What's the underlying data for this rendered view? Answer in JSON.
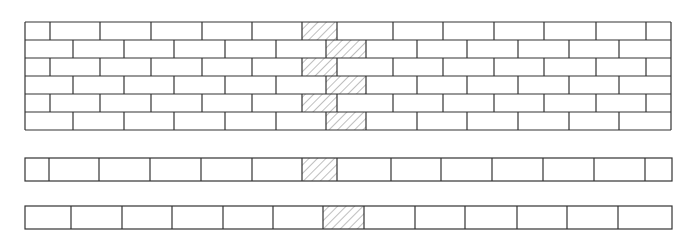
{
  "diagram": {
    "type": "brick-bond-illustration",
    "colors": {
      "line": "#333333",
      "hatch": "#8a8a8a",
      "background": "#ffffff"
    },
    "wall": {
      "x0": 25,
      "x1": 671,
      "row_tops": [
        22,
        40,
        58,
        76,
        94,
        112
      ],
      "row_bottom": 130,
      "odd_row_joints": [
        50,
        100,
        151,
        202,
        252,
        302,
        337,
        393,
        443,
        494,
        544,
        596,
        646
      ],
      "even_row_joints": [
        73,
        124,
        174,
        225,
        276,
        326,
        366,
        417,
        467,
        518,
        569,
        619
      ],
      "odd_hatch": [
        302,
        337
      ],
      "even_hatch": [
        326,
        366
      ]
    },
    "strips": [
      {
        "name": "strip-odd-course",
        "y0": 158,
        "y1": 181,
        "joints": [
          49,
          99,
          150,
          201,
          252,
          302,
          337,
          391,
          441,
          492,
          543,
          594,
          645
        ],
        "hatch": [
          302,
          337
        ]
      },
      {
        "name": "strip-even-course",
        "y0": 206,
        "y1": 229,
        "joints": [
          71,
          122,
          172,
          223,
          273,
          323,
          364,
          415,
          465,
          517,
          567,
          618
        ],
        "hatch": [
          323,
          364
        ]
      }
    ]
  }
}
